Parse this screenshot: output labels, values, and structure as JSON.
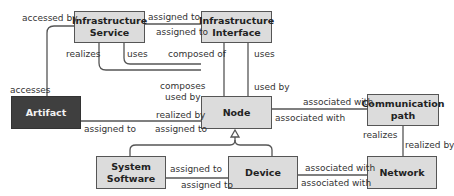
{
  "diagram": {
    "type": "ArchiMate technology layer metamodel",
    "colors": {
      "element_fill": "#dcdcdc",
      "artifact_fill": "#3f3f3f",
      "line": "#555555"
    },
    "elements": {
      "infrastructure_service": "Infrastructure\nService",
      "infrastructure_interface": "Infrastructure\nInterface",
      "artifact": "Artifact",
      "node": "Node",
      "communication_path": "Communication\npath",
      "system_software": "System\nSoftware",
      "device": "Device",
      "network": "Network"
    },
    "labels": {
      "accessed_by": "accessed by",
      "accesses": "accesses",
      "svc_iface_assigned_to_top": "assigned to",
      "svc_iface_assigned_to_bottom": "assigned to",
      "realizes_svc": "realizes",
      "uses_svc": "uses",
      "composed_of": "composed of",
      "uses_iface": "uses",
      "composes": "composes",
      "used_by_svc": "used by",
      "used_by_iface": "used by",
      "realized_by": "realized by",
      "artifact_assigned_to": "assigned to",
      "node_assigned_to": "assigned to",
      "node_assoc_top": "associated with",
      "node_assoc_bottom": "associated with",
      "cp_realizes": "realizes",
      "cp_realized_by": "realized by",
      "ss_assigned_to_top": "assigned to",
      "ss_assigned_to_bottom": "assigned to",
      "dev_assoc_top": "associated with",
      "dev_assoc_bottom": "associated with"
    }
  }
}
